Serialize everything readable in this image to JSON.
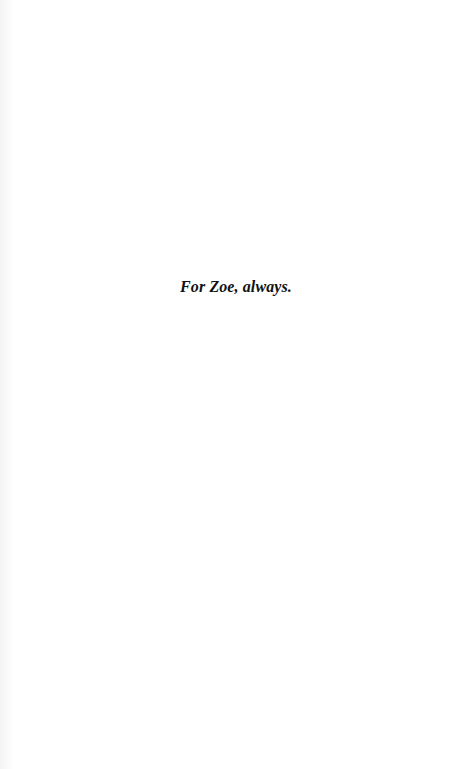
{
  "page": {
    "background": "#ffffff",
    "dedication": "For Zoe, always."
  }
}
